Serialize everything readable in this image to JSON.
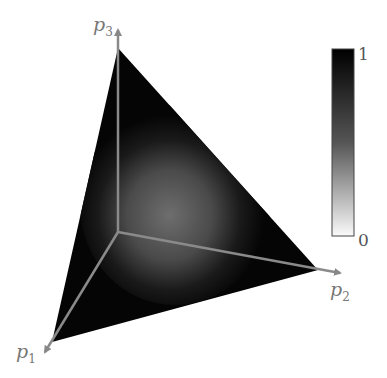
{
  "figure": {
    "type": "probability simplex heatmap",
    "axes": [
      {
        "id": "p1",
        "label": "p",
        "subscript": "1"
      },
      {
        "id": "p2",
        "label": "p",
        "subscript": "2"
      },
      {
        "id": "p3",
        "label": "p",
        "subscript": "3"
      }
    ],
    "colorbar": {
      "min_label": "0",
      "max_label": "1",
      "min_color": "#ffffff",
      "max_color": "#000000"
    },
    "colors": {
      "axis": "#888888",
      "fill_dark": "#050505",
      "fill_center": "#6a6a6a"
    }
  }
}
